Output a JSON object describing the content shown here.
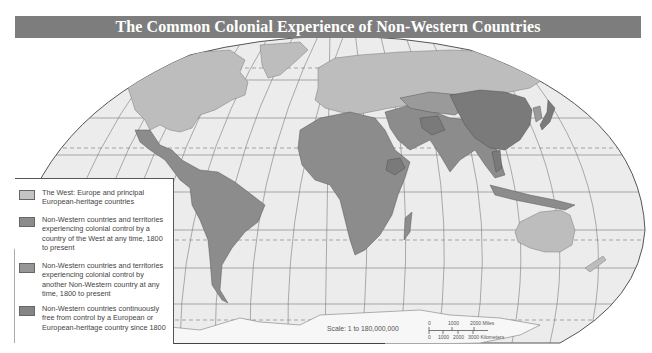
{
  "title": "The Common Colonial Experience of Non-Western Countries",
  "colors": {
    "title_bar": "#7d7d7d",
    "ocean": "#ebebeb",
    "west": "#bdbdbd",
    "colonized_by_west": "#8c8c8c",
    "colonized_by_non_west": "#9a9a9a",
    "never_colonized": "#7a7a7a",
    "grid": "#6f6f6f",
    "border": "#555555"
  },
  "legend": {
    "items": [
      {
        "label": "The West: Europe and principal European-heritage countries",
        "color_key": "west",
        "swatch": "#c4c4c4"
      },
      {
        "label": "Non-Western countries and territories experiencing colonial control by a country of the West at any time, 1800 to present",
        "color_key": "colonized_by_west",
        "swatch": "#8c8c8c"
      },
      {
        "label": "Non-Western countries and territories experiencing colonial control by another Non-Western country at any time, 1800 to present",
        "color_key": "colonized_by_non_west",
        "swatch": "#969696"
      },
      {
        "label": "Non-Western countries continuously free from control by a European or European-heritage country since 1800",
        "color_key": "never_colonized",
        "swatch": "#858585"
      }
    ]
  },
  "scale": {
    "label": "Scale: 1 to 180,000,000",
    "miles_ticks": [
      "0",
      "1000",
      "2000 Miles"
    ],
    "km_ticks": [
      "0",
      "1000",
      "2000",
      "3000 Kilometers"
    ]
  },
  "regions": {
    "west": [
      "North America (USA, Canada)",
      "Greenland",
      "Europe",
      "Russia",
      "Australia",
      "New Zealand"
    ],
    "colonized_by_west": [
      "Latin America",
      "Africa",
      "Middle East",
      "South Asia",
      "Southeast Asia",
      "Indonesia"
    ],
    "colonized_by_non_west": [
      "Central Asia",
      "Korea",
      "Taiwan"
    ],
    "never_colonized": [
      "China",
      "Japan",
      "Thailand",
      "Iran",
      "Ethiopia",
      "Mongolia"
    ]
  }
}
